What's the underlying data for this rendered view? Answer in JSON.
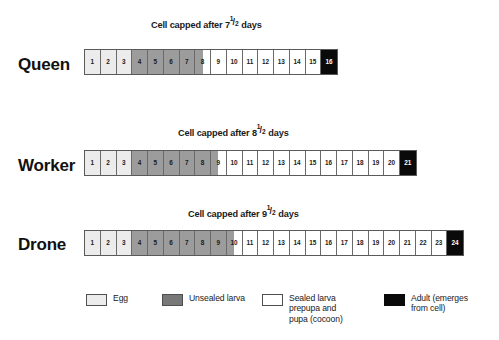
{
  "chart_data": {
    "type": "table",
    "xlabel": "Days of development",
    "ylabel": "Caste",
    "categories": [
      "Queen",
      "Worker",
      "Drone"
    ],
    "legend_position": "bottom",
    "grid": false,
    "series": [
      {
        "name": "Queen",
        "total_days": 16,
        "egg_days": [
          1,
          3
        ],
        "unsealed_larva_days": [
          4,
          8
        ],
        "capped_after_days": 7.5,
        "sealed_days": [
          8,
          15
        ],
        "adult_day": 16
      },
      {
        "name": "Worker",
        "total_days": 21,
        "egg_days": [
          1,
          3
        ],
        "unsealed_larva_days": [
          4,
          9
        ],
        "capped_after_days": 8.5,
        "sealed_days": [
          9,
          20
        ],
        "adult_day": 21
      },
      {
        "name": "Drone",
        "total_days": 24,
        "egg_days": [
          1,
          3
        ],
        "unsealed_larva_days": [
          4,
          10
        ],
        "capped_after_days": 9.5,
        "sealed_days": [
          10,
          23
        ],
        "adult_day": 24
      }
    ],
    "stage_colors": {
      "egg": "#ececec",
      "unsealed_larva": "#9c9c9c",
      "sealed_larva": "#ffffff",
      "adult": "#0a0a0a"
    }
  },
  "rows": [
    {
      "id": "queen",
      "label": "Queen",
      "caption_prefix": "Cell capped after ",
      "caption_whole": "7",
      "caption_num": "1",
      "caption_den": "2",
      "caption_suffix": " days",
      "cells": [
        {
          "n": "1",
          "stage": "egg"
        },
        {
          "n": "2",
          "stage": "egg"
        },
        {
          "n": "3",
          "stage": "egg"
        },
        {
          "n": "4",
          "stage": "larva"
        },
        {
          "n": "5",
          "stage": "larva"
        },
        {
          "n": "6",
          "stage": "larva"
        },
        {
          "n": "7",
          "stage": "larva"
        },
        {
          "n": "8",
          "stage": "half"
        },
        {
          "n": "9",
          "stage": "sealed"
        },
        {
          "n": "10",
          "stage": "sealed"
        },
        {
          "n": "11",
          "stage": "sealed"
        },
        {
          "n": "12",
          "stage": "sealed"
        },
        {
          "n": "13",
          "stage": "sealed"
        },
        {
          "n": "14",
          "stage": "sealed"
        },
        {
          "n": "15",
          "stage": "sealed"
        },
        {
          "n": "16",
          "stage": "adult"
        }
      ]
    },
    {
      "id": "worker",
      "label": "Worker",
      "caption_prefix": "Cell capped after ",
      "caption_whole": "8",
      "caption_num": "1",
      "caption_den": "2",
      "caption_suffix": " days",
      "cells": [
        {
          "n": "1",
          "stage": "egg"
        },
        {
          "n": "2",
          "stage": "egg"
        },
        {
          "n": "3",
          "stage": "egg"
        },
        {
          "n": "4",
          "stage": "larva"
        },
        {
          "n": "5",
          "stage": "larva"
        },
        {
          "n": "6",
          "stage": "larva"
        },
        {
          "n": "7",
          "stage": "larva"
        },
        {
          "n": "8",
          "stage": "larva"
        },
        {
          "n": "9",
          "stage": "half"
        },
        {
          "n": "10",
          "stage": "sealed"
        },
        {
          "n": "11",
          "stage": "sealed"
        },
        {
          "n": "12",
          "stage": "sealed"
        },
        {
          "n": "13",
          "stage": "sealed"
        },
        {
          "n": "14",
          "stage": "sealed"
        },
        {
          "n": "15",
          "stage": "sealed"
        },
        {
          "n": "16",
          "stage": "sealed"
        },
        {
          "n": "17",
          "stage": "sealed"
        },
        {
          "n": "18",
          "stage": "sealed"
        },
        {
          "n": "19",
          "stage": "sealed"
        },
        {
          "n": "20",
          "stage": "sealed"
        },
        {
          "n": "21",
          "stage": "adult"
        }
      ]
    },
    {
      "id": "drone",
      "label": "Drone",
      "caption_prefix": "Cell capped after ",
      "caption_whole": "9",
      "caption_num": "1",
      "caption_den": "2",
      "caption_suffix": " days",
      "cells": [
        {
          "n": "1",
          "stage": "egg"
        },
        {
          "n": "2",
          "stage": "egg"
        },
        {
          "n": "3",
          "stage": "egg"
        },
        {
          "n": "4",
          "stage": "larva"
        },
        {
          "n": "5",
          "stage": "larva"
        },
        {
          "n": "6",
          "stage": "larva"
        },
        {
          "n": "7",
          "stage": "larva"
        },
        {
          "n": "8",
          "stage": "larva"
        },
        {
          "n": "9",
          "stage": "larva"
        },
        {
          "n": "10",
          "stage": "half"
        },
        {
          "n": "11",
          "stage": "sealed"
        },
        {
          "n": "12",
          "stage": "sealed"
        },
        {
          "n": "13",
          "stage": "sealed"
        },
        {
          "n": "14",
          "stage": "sealed"
        },
        {
          "n": "15",
          "stage": "sealed"
        },
        {
          "n": "16",
          "stage": "sealed"
        },
        {
          "n": "17",
          "stage": "sealed"
        },
        {
          "n": "18",
          "stage": "sealed"
        },
        {
          "n": "19",
          "stage": "sealed"
        },
        {
          "n": "20",
          "stage": "sealed"
        },
        {
          "n": "21",
          "stage": "sealed"
        },
        {
          "n": "22",
          "stage": "sealed"
        },
        {
          "n": "23",
          "stage": "sealed"
        },
        {
          "n": "24",
          "stage": "adult"
        }
      ]
    }
  ],
  "legend": [
    {
      "id": "egg",
      "swatch": "s-egg",
      "text": "Egg"
    },
    {
      "id": "larva",
      "swatch": "s-larva",
      "text": "Unsealed larva"
    },
    {
      "id": "sealed",
      "swatch": "s-sealed",
      "text": "Sealed larva\nprepupa and\npupa (cocoon)"
    },
    {
      "id": "adult",
      "swatch": "s-adult",
      "text": "Adult (emerges\nfrom cell)"
    }
  ]
}
